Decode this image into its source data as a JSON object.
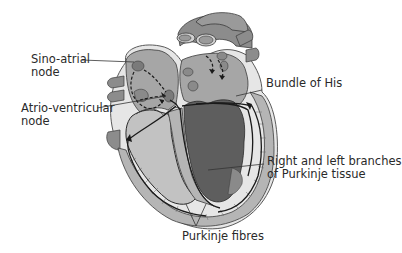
{
  "labels": {
    "sa_node_line1": "Sino-atrial",
    "sa_node_line2": "node",
    "av_node_line1": "Atrio-ventricular",
    "av_node_line2": "node",
    "bundle_of_his": "Bundle of His",
    "branches_line1": "Right and left branches",
    "branches_line2": "of Purkinje tissue",
    "purkinje_fibres": "Purkinje fibres"
  },
  "colors": {
    "background": "#ffffff",
    "vessel_fill": "#8c8c8c",
    "vessel_outline": "#3a3a3a",
    "atrium_fill": "#a6a6a6",
    "right_ventricle_fill": "#c2c2c2",
    "left_ventricle_fill": "#5e5e5e",
    "wall_fill": "#b5b5b5",
    "pericardium_fill": "#e6e6e6",
    "node_fill": "#7a7a7a",
    "conduction_line": "#1a1a1a",
    "text": "#2a2a2a"
  }
}
